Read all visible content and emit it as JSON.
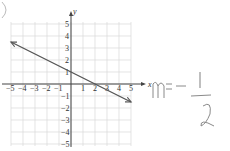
{
  "chart_data": {
    "type": "line",
    "title": "",
    "xlabel": "x",
    "ylabel": "y",
    "xlim": [
      -5,
      5
    ],
    "ylim": [
      -5,
      5
    ],
    "grid": true,
    "x_ticks": [
      "-5",
      "-4",
      "-3",
      "-2",
      "-1",
      "1",
      "2",
      "3",
      "4",
      "5"
    ],
    "y_ticks": [
      "5",
      "4",
      "3",
      "2",
      "1",
      "-1",
      "-2",
      "-3",
      "-4",
      "-5"
    ],
    "series": [
      {
        "name": "line",
        "x": [
          -5,
          5
        ],
        "y": [
          3.5,
          -1.5
        ],
        "arrows": "both",
        "slope": -0.5,
        "intercept": 1
      }
    ],
    "annotations": [
      {
        "text": "m = -1/2",
        "handwritten": true
      }
    ]
  },
  "labels": {
    "x_axis": "x",
    "y_axis": "y",
    "handwritten_m": "m=",
    "handwritten_minus": "−",
    "handwritten_num": "1",
    "handwritten_den": "2"
  },
  "colors": {
    "grid": "#d8d8d8",
    "axis": "#444444",
    "line": "#555555",
    "pencil": "#8a8a8a"
  }
}
